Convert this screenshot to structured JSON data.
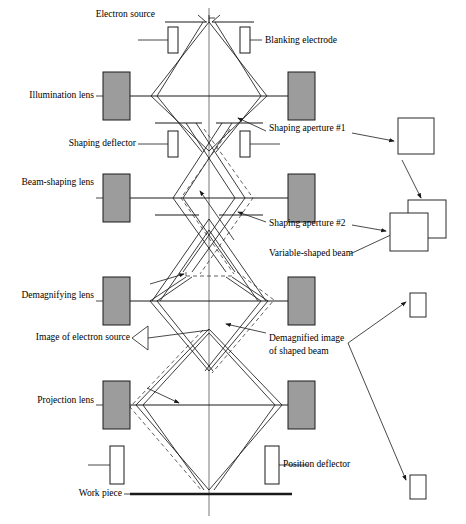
{
  "figure": {
    "width": 466,
    "height": 524,
    "background_color": "#ffffff",
    "line_color": "#1a1a1a",
    "lens_fill_color": "#9c9c9c",
    "axis_color": "#555555"
  },
  "labels": {
    "electron_source": "Electron source",
    "illumination_lens": "Illumination lens",
    "shaping_deflector": "Shaping deflector",
    "beam_shaping_lens": "Beam-shaping lens",
    "demagnifying_lens": "Demagnifying lens",
    "image_of_electron_source": "Image of electron source",
    "projection_lens": "Projection lens",
    "work_piece": "Work piece",
    "blanking_electrode": "Blanking electrode",
    "shaping_aperture_1": "Shaping aperture #1",
    "shaping_aperture_2": "Shaping aperture #2",
    "variable_shaped_beam": "Variable-shaped beam",
    "demagnified_image_line1": "Demagnified image",
    "demagnified_image_line2": "of shaped beam",
    "position_deflector": "Position deflector"
  },
  "components": {
    "lenses": [
      {
        "name": "illumination-lens",
        "x": 103,
        "y": 72,
        "width": 27,
        "height": 48
      },
      {
        "name": "illumination-lens-right",
        "x": 288,
        "y": 72,
        "width": 27,
        "height": 48
      },
      {
        "name": "beam-shaping-lens",
        "x": 103,
        "y": 174,
        "width": 27,
        "height": 48
      },
      {
        "name": "beam-shaping-lens-right",
        "x": 288,
        "y": 174,
        "width": 27,
        "height": 48
      },
      {
        "name": "demagnifying-lens",
        "x": 103,
        "y": 277,
        "width": 27,
        "height": 48
      },
      {
        "name": "demagnifying-lens-right",
        "x": 288,
        "y": 277,
        "width": 27,
        "height": 48
      },
      {
        "name": "projection-lens",
        "x": 103,
        "y": 381,
        "width": 27,
        "height": 48
      },
      {
        "name": "projection-lens-right",
        "x": 288,
        "y": 381,
        "width": 27,
        "height": 48
      }
    ],
    "deflector_plates": [
      {
        "name": "blanking-electrode-left",
        "x": 168,
        "y": 27,
        "width": 10,
        "height": 26
      },
      {
        "name": "blanking-electrode-right",
        "x": 240,
        "y": 27,
        "width": 10,
        "height": 26
      },
      {
        "name": "shaping-deflector-left",
        "x": 168,
        "y": 131,
        "width": 10,
        "height": 26
      },
      {
        "name": "shaping-deflector-right",
        "x": 240,
        "y": 131,
        "width": 10,
        "height": 26
      },
      {
        "name": "position-deflector-left",
        "x": 110,
        "y": 446,
        "width": 14,
        "height": 38
      },
      {
        "name": "position-deflector-right",
        "x": 265,
        "y": 446,
        "width": 14,
        "height": 38
      }
    ],
    "lens_planes": [
      {
        "name": "illumination-lens-plane",
        "y": 96,
        "x1": 130,
        "x2": 288
      },
      {
        "name": "beam-shaping-lens-plane",
        "y": 198,
        "x1": 130,
        "x2": 288
      },
      {
        "name": "demagnifying-lens-plane",
        "y": 301,
        "x1": 130,
        "x2": 288
      },
      {
        "name": "projection-lens-plane",
        "y": 405,
        "x1": 130,
        "x2": 288
      }
    ],
    "apertures": [
      {
        "name": "source-aperture",
        "y": 22,
        "left_x1": 163,
        "left_x2": 205,
        "right_x1": 213,
        "right_x2": 255
      },
      {
        "name": "shaping-aperture-1",
        "y": 123,
        "left_x1": 155,
        "left_x2": 205,
        "right_x1": 213,
        "right_x2": 263
      },
      {
        "name": "shaping-aperture-2",
        "y": 215,
        "left_x1": 155,
        "left_x2": 205,
        "right_x1": 213,
        "right_x2": 263
      }
    ],
    "workpiece": {
      "name": "work-piece-line",
      "y": 494,
      "x1": 130,
      "x2": 292
    },
    "optic_axis": {
      "x": 209,
      "y1": 8,
      "y2": 516
    }
  },
  "callouts": [
    {
      "name": "shaping-aperture-1-square",
      "x": 398,
      "y": 118,
      "width": 36,
      "height": 36,
      "shape": "square"
    },
    {
      "name": "variable-shaped-beam-square-back",
      "x": 408,
      "y": 200,
      "width": 38,
      "height": 38,
      "shape": "square"
    },
    {
      "name": "variable-shaped-beam-square-front",
      "x": 390,
      "y": 213,
      "width": 38,
      "height": 38,
      "shape": "square"
    },
    {
      "name": "demagnified-image-rect-upper",
      "x": 410,
      "y": 293,
      "width": 16,
      "height": 24,
      "shape": "rect"
    },
    {
      "name": "demagnified-image-rect-lower",
      "x": 410,
      "y": 475,
      "width": 16,
      "height": 24,
      "shape": "rect"
    }
  ],
  "label_positions": {
    "electron_source": {
      "x": 155,
      "y": 15
    },
    "illumination_lens": {
      "x": 97,
      "y": 96
    },
    "shaping_deflector": {
      "x": 97,
      "y": 144
    },
    "beam_shaping_lens": {
      "x": 97,
      "y": 183
    },
    "demagnifying_lens": {
      "x": 97,
      "y": 296
    },
    "image_of_electron_source": {
      "x": 128,
      "y": 338
    },
    "projection_lens": {
      "x": 97,
      "y": 401
    },
    "work_piece": {
      "x": 124,
      "y": 494
    },
    "blanking_electrode": {
      "x": 265,
      "y": 41
    },
    "shaping_aperture_1": {
      "x": 268,
      "y": 128
    },
    "shaping_aperture_2": {
      "x": 268,
      "y": 224
    },
    "variable_shaped_beam": {
      "x": 268,
      "y": 257
    },
    "demagnified_image_line1": {
      "x": 268,
      "y": 338
    },
    "demagnified_image_line2": {
      "x": 268,
      "y": 350
    },
    "position_deflector": {
      "x": 283,
      "y": 464
    }
  },
  "rays": {
    "upper_envelope_solid": [
      "M 209 22 L 151 96 L 209 151",
      "M 209 22 L 267 96 L 209 151",
      "M 203 22 L 157 96 L 203 151",
      "M 215 22 L 261 96 L 215 151",
      "M 198 17 L 198 22",
      "M 220 17 L 220 22"
    ],
    "shaping_solid": [
      "M 196 123 L 243 198 L 196 270",
      "M 222 123 L 175 198 L 222 270",
      "M 184 123 L 231 198 L 184 270",
      "M 234 123 L 187 198 L 234 270"
    ],
    "shaping_dashed": [
      "M 203 131 L 250 198 L 203 272",
      "M 229 131 L 182 198 L 229 272"
    ],
    "lower_envelope_solid": [
      "M 185 280 L 149 301 L 209 372",
      "M 233 280 L 269 301 L 209 372",
      "M 190 280 L 155 301 L 212 372",
      "M 228 280 L 263 301 L 206 372"
    ],
    "projection_solid": [
      "M 209 330 L 136 405 L 209 489",
      "M 209 330 L 282 405 L 209 489",
      "M 209 333 L 142 405 L 205 489",
      "M 209 333 L 276 405 L 213 489"
    ],
    "projection_dashed": [
      "M 200 332 L 130 408 L 203 490"
    ],
    "cross_solid": [
      "M 152 300 L 209 220",
      "M 209 220 L 266 300"
    ]
  },
  "leaders": {
    "electron_source": "M 195 18 L 209 18",
    "illumination_lens": "M 103 96 L 96 96",
    "beam_shaping_lens": "M 103 198 L 96 198",
    "demagnifying_lens": "M 103 301 L 96 301",
    "projection_lens": "M 103 405 L 96 405",
    "shaping_deflector_lead": "M 168 144 L 136 144",
    "blanking_electrode_lead": "M 250 41 L 263 41",
    "position_deflector_lead": "M 124 465 L 155 465",
    "position_deflector_lead_right": "M 279 465 L 310 465",
    "work_piece_lead": "M 130 494 L 126 494",
    "illumination_lens_lead_right": "M 288 96 L 315 96",
    "beam_shaping_lens_lead_right": "M 288 198 L 315 198",
    "demagnifying_lens_lead_right": "M 288 301 L 315 301",
    "projection_lens_lead_right": "M 288 405 L 315 405"
  },
  "arrows": [
    {
      "name": "arrow-to-shaping-aperture-1",
      "path": "M 265 131 L 237 119"
    },
    {
      "name": "arrow-shaping-aperture-1-to-square",
      "path": "M 352 132 L 396 140"
    },
    {
      "name": "arrow-to-shaping-aperture-2",
      "path": "M 265 222 L 237 211"
    },
    {
      "name": "arrow-shaping-aperture-2-to-square",
      "path": "M 352 224 L 388 230"
    },
    {
      "name": "arrow-variable-beam-to-overlap",
      "path": "M 352 252 L 408 228"
    },
    {
      "name": "arrow-square1-to-overlap",
      "path": "M 405 158 L 424 200"
    },
    {
      "name": "arrow-to-demagnified-image",
      "path": "M 265 332 L 225 324"
    },
    {
      "name": "arrow-demagnified-to-upper-rect",
      "path": "M 352 342 L 408 300"
    },
    {
      "name": "arrow-demagnified-to-lower-rect",
      "path": "M 352 342 L 408 482"
    },
    {
      "name": "arrow-variable-beam-in-column",
      "path": "M 232 238 L 197 190"
    },
    {
      "name": "arrow-image-source-in-column",
      "path": "M 150 282 L 185 275"
    },
    {
      "name": "arrow-projection-in-column",
      "path": "M 148 388 L 180 404"
    }
  ]
}
